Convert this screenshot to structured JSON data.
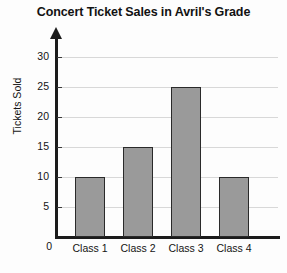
{
  "chart_data": {
    "type": "bar",
    "title": "Concert Ticket Sales in Avril's Grade",
    "xlabel": "",
    "ylabel": "Tickets Sold",
    "categories": [
      "Class 1",
      "Class 2",
      "Class 3",
      "Class 4"
    ],
    "values": [
      10,
      15,
      25,
      10
    ],
    "ylim": [
      0,
      30
    ],
    "ytick_labels": [
      "0",
      "5",
      "10",
      "15",
      "20",
      "25",
      "30"
    ],
    "ytick_values": [
      0,
      5,
      10,
      15,
      20,
      25,
      30
    ],
    "grid": true,
    "legend": false,
    "bar_color": "#9a9a9a",
    "bar_border_color": "#2a2a2a",
    "grid_color": "#d8d8d8",
    "axis_color": "#1b1b1b",
    "background_color": "#fdfdfd"
  }
}
